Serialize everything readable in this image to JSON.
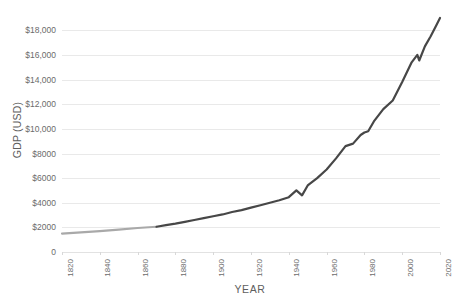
{
  "chart_data": {
    "type": "line",
    "title": "",
    "xlabel": "YEAR",
    "ylabel": "GDP (USD)",
    "xlim": [
      1820,
      2020
    ],
    "ylim": [
      0,
      19000
    ],
    "grid": true,
    "legend": false,
    "x_tick_labels": [
      "1820",
      "1840",
      "1860",
      "1880",
      "1900",
      "1920",
      "1940",
      "1960",
      "1980",
      "2000",
      "2020"
    ],
    "x_ticks": [
      1820,
      1840,
      1860,
      1880,
      1900,
      1920,
      1940,
      1960,
      1980,
      2000,
      2020
    ],
    "y_tick_labels": [
      "0",
      "$2000",
      "$4000",
      "$6000",
      "$8000",
      "$10,000",
      "$12,000",
      "$14,000",
      "$16,000",
      "$18,000"
    ],
    "y_ticks": [
      0,
      2000,
      4000,
      6000,
      8000,
      10000,
      12000,
      14000,
      16000,
      18000
    ],
    "colors": {
      "early_segment": "#a9a9a9",
      "late_segment": "#474747",
      "gridline": "#e9e9e9",
      "text": "#6b6b6b",
      "background": "#ffffff"
    },
    "series": [
      {
        "name": "GDP per capita (early)",
        "color": "#a9a9a9",
        "x": [
          1820,
          1830,
          1840,
          1850,
          1860,
          1870
        ],
        "values": [
          1500,
          1600,
          1700,
          1820,
          1950,
          2050
        ]
      },
      {
        "name": "GDP per capita (modern)",
        "color": "#474747",
        "x": [
          1870,
          1875,
          1880,
          1885,
          1890,
          1895,
          1900,
          1905,
          1910,
          1915,
          1920,
          1925,
          1930,
          1935,
          1940,
          1944,
          1947,
          1950,
          1955,
          1960,
          1965,
          1970,
          1974,
          1978,
          1980,
          1982,
          1985,
          1990,
          1995,
          2000,
          2005,
          2008,
          2009,
          2012,
          2015,
          2018,
          2020
        ],
        "values": [
          2050,
          2180,
          2300,
          2450,
          2600,
          2750,
          2900,
          3050,
          3250,
          3400,
          3600,
          3800,
          4000,
          4200,
          4450,
          5000,
          4600,
          5400,
          6000,
          6700,
          7600,
          8600,
          8800,
          9500,
          9700,
          9800,
          10600,
          11600,
          12300,
          13800,
          15400,
          16000,
          15550,
          16700,
          17500,
          18400,
          19000
        ]
      }
    ]
  }
}
